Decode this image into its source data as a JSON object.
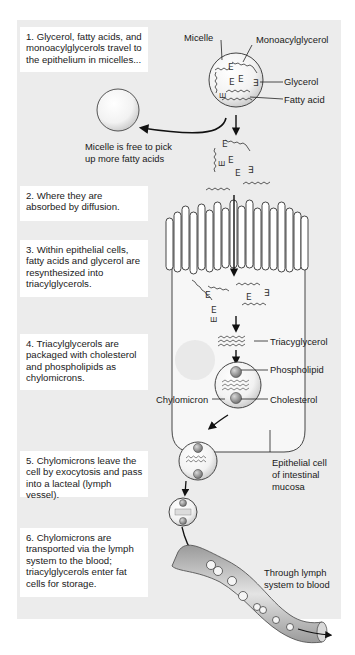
{
  "steps": [
    {
      "text": "1. Glycerol, fatty acids, and monoacylglycerols travel to the epithelium in micelles..."
    },
    {
      "text": "2. Where they are absorbed by diffusion."
    },
    {
      "text": "3. Within epithelial cells, fatty acids and glycerol are resynthesized into triacylglycerols."
    },
    {
      "text": "4. Triacylglycerols are packaged with cholesterol and phospholipids as chylomicrons."
    },
    {
      "text": "5. Chylomicrons leave the cell by exocytosis and pass into a lacteal (lymph vessel)."
    },
    {
      "text": "6. Chylomicrons are transported via the lymph system to the blood; triacylglycerols enter fat cells for storage."
    }
  ],
  "labels": {
    "micelle": "Micelle",
    "monoacylglycerol": "Monoacylglycerol",
    "glycerol": "Glycerol",
    "fatty_acid": "Fatty acid",
    "micelle_free_line1": "Micelle is free to pick",
    "micelle_free_line2": "up more fatty acids",
    "triacylglycerol": "Triacyglycerol",
    "phospholipid": "Phospholipid",
    "chylomicron": "Chylomicron",
    "cholesterol": "Cholesterol",
    "epithelial_line1": "Epithelial cell",
    "epithelial_line2": "of intestinal",
    "epithelial_line3": "mucosa",
    "lymph_line1": "Through lymph",
    "lymph_line2": "system to blood"
  },
  "colors": {
    "panel_bg": "#ececec",
    "box_bg": "#ffffff",
    "line": "#222222",
    "sphere": "#8a8a8a"
  }
}
